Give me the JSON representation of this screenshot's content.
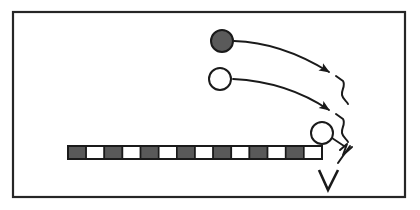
{
  "figure": {
    "background_color": "#ffffff",
    "stroke_color": "#1a1a1a",
    "fill_dark": "#595959",
    "fill_light": "#ffffff"
  },
  "frame": {
    "name": "diagram-border",
    "x": 13,
    "y": 12,
    "width": 392,
    "height": 185,
    "stroke_width": 2.2,
    "color": "#262626"
  },
  "circles": [
    {
      "name": "filled-ball",
      "label": "dark filled circle",
      "cx": 222,
      "cy": 41,
      "r": 11,
      "fill": "#5a5a5a",
      "stroke": "#1a1a1a",
      "stroke_width": 2.0,
      "filled": true
    },
    {
      "name": "open-ball",
      "label": "open white circle",
      "cx": 220,
      "cy": 79,
      "r": 11,
      "fill": "#ffffff",
      "stroke": "#1a1a1a",
      "stroke_width": 2.0,
      "filled": false
    },
    {
      "name": "lower-open-ball",
      "label": "lower open white circle",
      "cx": 322,
      "cy": 133,
      "r": 11,
      "fill": "#ffffff",
      "stroke": "#1a1a1a",
      "stroke_width": 2.0,
      "filled": false
    }
  ],
  "arrows": [
    {
      "name": "trajectory-arrow-upper",
      "label": "curved arrow from filled ball",
      "path": "M 234 41 C 270 42 300 54 329 72",
      "arrow_tip": {
        "x": 332,
        "y": 74
      },
      "stroke_width": 1.8
    },
    {
      "name": "trajectory-arrow-lower",
      "label": "curved arrow from open ball",
      "path": "M 233 79 C 272 81 304 93 329 110",
      "arrow_tip": {
        "x": 332,
        "y": 112
      },
      "stroke_width": 1.8
    }
  ],
  "connector": {
    "name": "ball-to-squiggle-connector",
    "label": "short line from lower ball to squiggle",
    "path": "M 332 138 L 344 146",
    "stroke_width": 1.8
  },
  "squiggles": [
    {
      "name": "squiggle-mark-upper",
      "label": "hand drawn squiggle bracket upper",
      "path": "M 336 76 L 343 81 C 346 86 341 90 342 95 C 343 100 347 101 348 104"
    },
    {
      "name": "squiggle-mark-middle",
      "label": "hand drawn squiggle bracket middle",
      "path": "M 336 114 L 343 119 C 346 124 341 128 342 133 C 343 138 347 139 348 142"
    },
    {
      "name": "squiggle-mark-lower",
      "label": "hand drawn zigzag near barrier end",
      "path": "M 340 150 L 347 144 L 343 155 L 352 147"
    },
    {
      "name": "squiggle-mark-tail",
      "label": "angled tail stroke toward V",
      "path": "M 350 146 L 338 163"
    }
  ],
  "vee": {
    "name": "vee-mark",
    "label": "V shaped mark below barrier end",
    "path": "M 319 170 L 328 190 L 338 170",
    "stroke_width": 2.6
  },
  "barrier": {
    "name": "checkered-barrier",
    "label": "horizontal checkered bar",
    "x": 68,
    "y": 146,
    "width": 254,
    "height": 13,
    "stroke_width": 1.6,
    "segment_count": 14,
    "segments": [
      {
        "index": 0,
        "fill": "dark"
      },
      {
        "index": 1,
        "fill": "light"
      },
      {
        "index": 2,
        "fill": "dark"
      },
      {
        "index": 3,
        "fill": "light"
      },
      {
        "index": 4,
        "fill": "dark"
      },
      {
        "index": 5,
        "fill": "light"
      },
      {
        "index": 6,
        "fill": "dark"
      },
      {
        "index": 7,
        "fill": "light"
      },
      {
        "index": 8,
        "fill": "dark"
      },
      {
        "index": 9,
        "fill": "light"
      },
      {
        "index": 10,
        "fill": "dark"
      },
      {
        "index": 11,
        "fill": "light"
      },
      {
        "index": 12,
        "fill": "dark"
      },
      {
        "index": 13,
        "fill": "light"
      }
    ]
  }
}
